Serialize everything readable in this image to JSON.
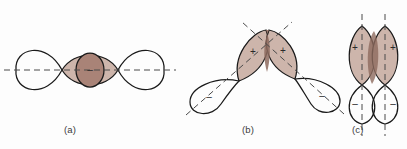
{
  "figure": {
    "background_color": "#fdfdfd",
    "outline_color": "#1a1a1a",
    "axis_color": "#4a4a4a",
    "shade_light": "#cdb5ab",
    "shade_medium": "#a98377",
    "shade_overlap": "#8d6a5e",
    "sign_color": "#2a2a2a"
  },
  "panels": [
    {
      "id": "a",
      "caption": "(a)",
      "description": "Head-on (sigma) overlap of two p orbitals along a horizontal axis",
      "axis_orientation": "horizontal",
      "axis_style": "dashed",
      "overlap_shape": "lens",
      "lobes": [
        {
          "position": "far-left",
          "sign": "",
          "shaded": false
        },
        {
          "position": "center-left",
          "sign": "",
          "shaded": true
        },
        {
          "position": "center-right",
          "sign": "",
          "shaded": true
        },
        {
          "position": "far-right",
          "sign": "",
          "shaded": false
        }
      ],
      "center_circle": {
        "present": true,
        "sign": "–",
        "shaded": true
      }
    },
    {
      "id": "b",
      "caption": "(b)",
      "description": "Angled overlap of two p orbitals whose axes are inclined toward each other",
      "axis_orientation": "slanted",
      "axis_style": "dashed",
      "overlap_shape": "small-lens",
      "lobes": [
        {
          "position": "upper-left",
          "sign": "+",
          "shaded": true
        },
        {
          "position": "upper-right",
          "sign": "+",
          "shaded": true
        },
        {
          "position": "lower-left",
          "sign": "–",
          "shaded": false
        },
        {
          "position": "lower-right",
          "sign": "–",
          "shaded": false
        }
      ],
      "center_circle": {
        "present": false,
        "sign": "",
        "shaded": false
      }
    },
    {
      "id": "c",
      "caption": "(c)",
      "description": "Side-by-side (pi) overlap of two parallel p orbitals with vertical axes",
      "axis_orientation": "vertical",
      "axis_style": "dashed",
      "overlap_shape": "sliver",
      "lobes": [
        {
          "position": "upper-left",
          "sign": "+",
          "shaded": true
        },
        {
          "position": "upper-right",
          "sign": "+",
          "shaded": true
        },
        {
          "position": "lower-left",
          "sign": "–",
          "shaded": false
        },
        {
          "position": "lower-right",
          "sign": "–",
          "shaded": false
        }
      ],
      "center_circle": {
        "present": false,
        "sign": "",
        "shaded": false
      }
    }
  ]
}
